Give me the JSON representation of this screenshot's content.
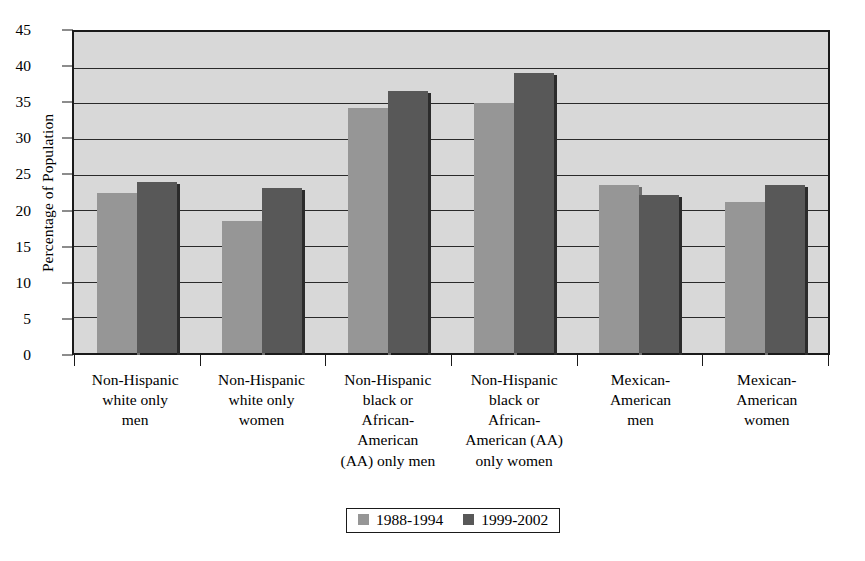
{
  "chart_data": {
    "type": "bar",
    "title": "",
    "xlabel": "",
    "ylabel": "Percentage of Population",
    "ylim": [
      0,
      45
    ],
    "ytick_step": 5,
    "yticks": [
      0,
      5,
      10,
      15,
      20,
      25,
      30,
      35,
      40,
      45
    ],
    "grid": true,
    "legend_position": "bottom",
    "categories": [
      "Non-Hispanic\nwhite only\nmen",
      "Non-Hispanic\nwhite only\nwomen",
      "Non-Hispanic\nblack or\nAfrican-\nAmerican\n(AA) only men",
      "Non-Hispanic\nblack or\nAfrican-\nAmerican (AA)\nonly women",
      "Mexican-\nAmerican\nmen",
      "Mexican-\nAmerican\nwomen"
    ],
    "series": [
      {
        "name": "1988-1994",
        "color": "#969696",
        "values": [
          22.5,
          18.5,
          34.3,
          35.0,
          23.5,
          21.2
        ]
      },
      {
        "name": "1999-2002",
        "color": "#585858",
        "values": [
          24.0,
          23.2,
          36.7,
          39.3,
          22.2,
          23.5
        ]
      }
    ],
    "plot_background": "#d8d8d8",
    "axis_color": "#1a1a1a"
  },
  "legend": {
    "items": [
      {
        "label": "1988-1994"
      },
      {
        "label": "1999-2002"
      }
    ]
  },
  "axes": {
    "y_title": "Percentage of Population"
  }
}
